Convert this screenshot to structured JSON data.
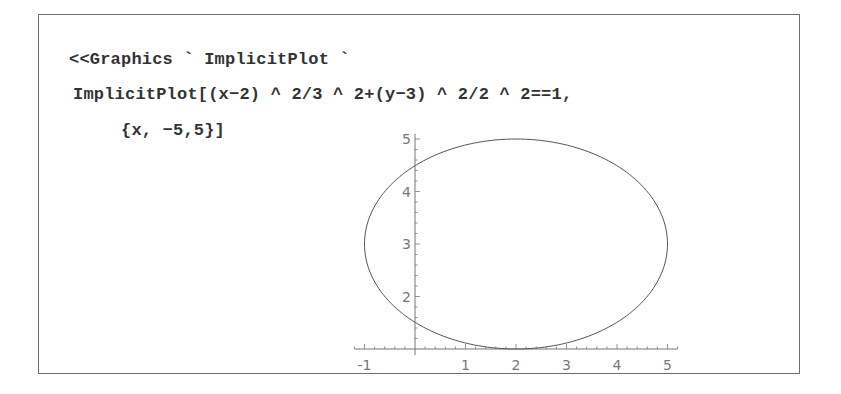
{
  "notebook": {
    "input_lines": [
      "<<Graphics`ImplicitPlot`",
      "ImplicitPlot[(x−2)^2/3^2+(y−3)^2/2^2==1,",
      "{x,−5,5}]"
    ],
    "display_lines": [
      "<<Graphics ` ImplicitPlot `",
      "ImplicitPlot[(x−2) ^ 2/3 ^ 2+(y−3) ^ 2/2 ^ 2==1,",
      "{x, −5,5}]"
    ]
  },
  "chart_data": {
    "type": "line",
    "title": "",
    "xlabel": "",
    "ylabel": "",
    "equation": "(x-2)^2/3^2 + (y-3)^2/2^2 == 1",
    "shape": "ellipse",
    "center": [
      2,
      3
    ],
    "semi_axes": {
      "x": 3,
      "y": 2
    },
    "x_ticks": [
      "-1",
      "1",
      "2",
      "3",
      "4",
      "5"
    ],
    "y_ticks": [
      "2",
      "3",
      "4",
      "5"
    ],
    "xlim": [
      -1.2,
      5.2
    ],
    "ylim": [
      1,
      5.1
    ],
    "axes_origin": [
      0,
      1
    ],
    "grid": false,
    "legend": null,
    "series": [
      {
        "name": "ellipse",
        "points": [
          [
            -1,
            3
          ],
          [
            -0.6,
            4
          ],
          [
            0,
            4.49
          ],
          [
            0.5,
            4.73
          ],
          [
            1,
            4.89
          ],
          [
            2,
            5
          ],
          [
            3,
            4.89
          ],
          [
            4,
            4.49
          ],
          [
            4.6,
            4
          ],
          [
            5,
            3
          ],
          [
            4.6,
            2
          ],
          [
            4,
            1.51
          ],
          [
            3,
            1.11
          ],
          [
            2,
            1
          ],
          [
            1,
            1.11
          ],
          [
            0,
            1.51
          ],
          [
            -0.6,
            2
          ],
          [
            -1,
            3
          ]
        ]
      }
    ],
    "line_color": "#555555"
  }
}
